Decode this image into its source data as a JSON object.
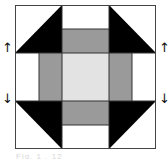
{
  "diagram": {
    "grid": {
      "rows": 3,
      "cols": 3
    },
    "colors": {
      "dark": "#000000",
      "medium": "#9a9a9a",
      "light": "#e3e3e3",
      "background": "#ffffff",
      "line": "#333333"
    },
    "cells": [
      {
        "pos": "top-left",
        "type": "half-square-triangle",
        "dark_corner": "bottom-right"
      },
      {
        "pos": "top-center",
        "type": "two-strip",
        "outer": "white",
        "inner": "medium"
      },
      {
        "pos": "top-right",
        "type": "half-square-triangle",
        "dark_corner": "bottom-left"
      },
      {
        "pos": "middle-left",
        "type": "two-strip",
        "outer": "white",
        "inner": "medium"
      },
      {
        "pos": "center",
        "type": "square",
        "fill": "light"
      },
      {
        "pos": "middle-right",
        "type": "two-strip",
        "outer": "white",
        "inner": "medium"
      },
      {
        "pos": "bottom-left",
        "type": "half-square-triangle",
        "dark_corner": "top-right"
      },
      {
        "pos": "bottom-center",
        "type": "two-strip",
        "outer": "white",
        "inner": "medium"
      },
      {
        "pos": "bottom-right",
        "type": "half-square-triangle",
        "dark_corner": "top-left"
      }
    ],
    "arrows": {
      "left_up": "↑",
      "left_down": "↓",
      "right_up": "↑",
      "right_down": "↓"
    },
    "caption": "Fig. 1 . 12"
  }
}
